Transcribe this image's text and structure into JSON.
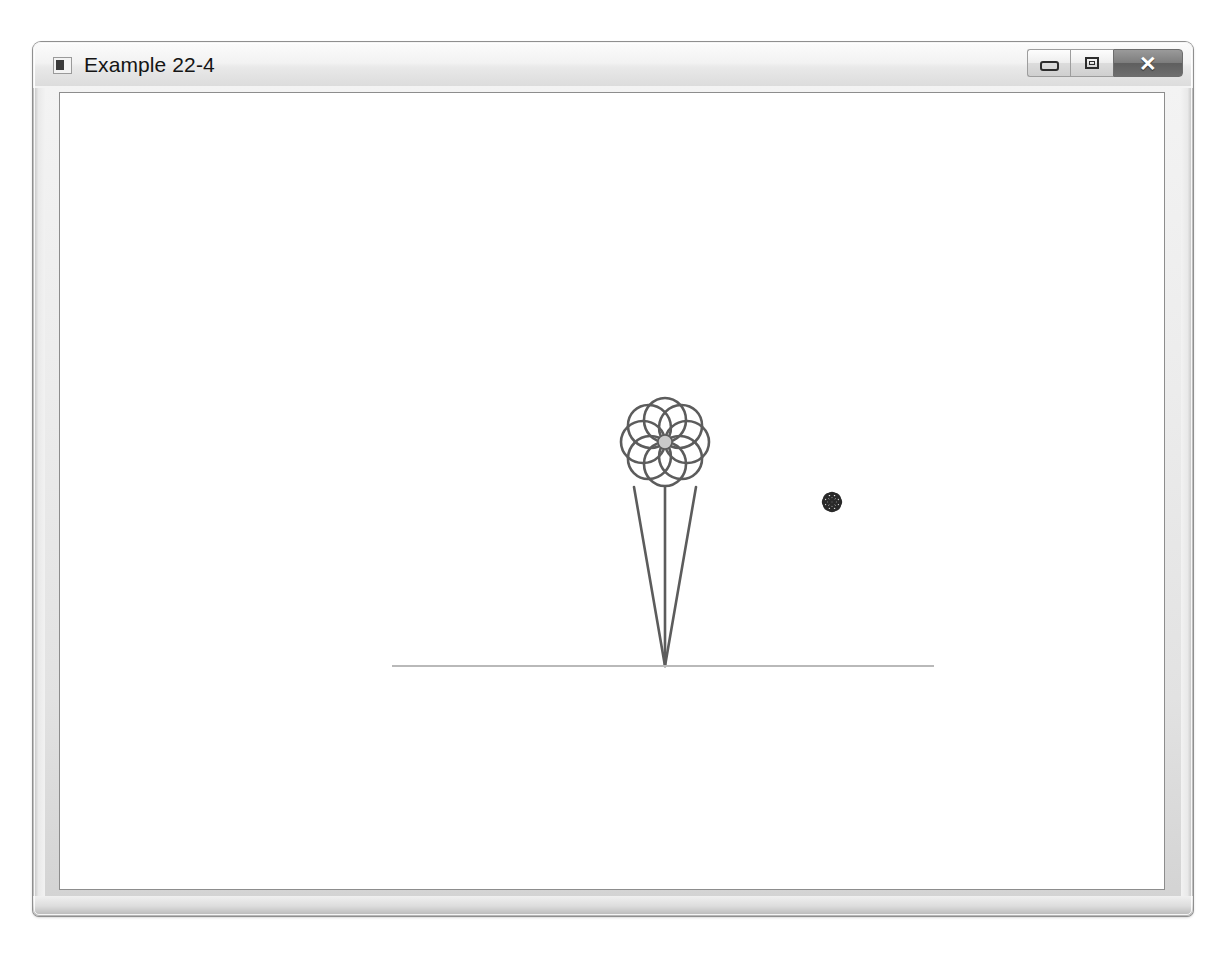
{
  "window": {
    "title": "Example 22-4",
    "icon": "application-window-icon",
    "buttons": {
      "minimize_label": "–",
      "maximize_label": "□",
      "close_label": "✕"
    }
  },
  "canvas": {
    "name": "drawing-canvas",
    "background": "#ffffff",
    "ground_line": {
      "x1": 332,
      "y1": 573,
      "x2": 874,
      "y2": 573,
      "color": "#b9b9b9",
      "width": 2
    },
    "flowers": [
      {
        "name": "large-flower",
        "center_x": 605,
        "center_y": 349,
        "petal_count": 8,
        "petal_length": 44,
        "petal_width": 21,
        "center_radius": 7,
        "outline_color": "#5c5c5c",
        "center_fill": "#c9c9c9",
        "stroke_width": 2.6
      },
      {
        "name": "small-flower",
        "center_x": 772,
        "center_y": 409,
        "petal_count": 8,
        "petal_length": 9,
        "petal_width": 5,
        "center_radius": 2,
        "outline_color": "#2a2a2a",
        "center_fill": "#3a3a3a",
        "stroke_width": 2.4
      }
    ],
    "stems": [
      {
        "name": "stem-left",
        "x1": 574,
        "y1": 394,
        "x2": 605,
        "y2": 573,
        "color": "#5c5c5c",
        "width": 2.6
      },
      {
        "name": "stem-center",
        "x1": 605,
        "y1": 394,
        "x2": 605,
        "y2": 573,
        "color": "#5c5c5c",
        "width": 2.6
      },
      {
        "name": "stem-right",
        "x1": 636,
        "y1": 394,
        "x2": 605,
        "y2": 573,
        "color": "#5c5c5c",
        "width": 2.6
      }
    ]
  }
}
